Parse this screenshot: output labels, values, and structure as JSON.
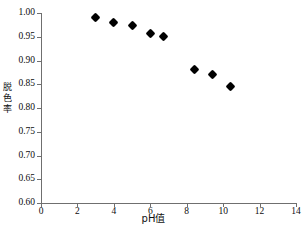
{
  "chart_data": {
    "type": "scatter",
    "title": "",
    "xlabel": "pH值",
    "ylabel": "脱色率",
    "xlim": [
      0,
      14
    ],
    "ylim": [
      0.6,
      1.0
    ],
    "grid": false,
    "legend": null,
    "x_ticks": [
      "0",
      "2",
      "4",
      "6",
      "8",
      "10",
      "12",
      "14"
    ],
    "x_tick_values": [
      0,
      2,
      4,
      6,
      8,
      10,
      12,
      14
    ],
    "y_ticks": [
      "0.60",
      "0.65",
      "0.70",
      "0.75",
      "0.80",
      "0.85",
      "0.90",
      "0.95",
      "1.00"
    ],
    "y_tick_values": [
      0.6,
      0.65,
      0.7,
      0.75,
      0.8,
      0.85,
      0.9,
      0.95,
      1.0
    ],
    "marker": "filled-diamond",
    "marker_color": "#000000",
    "axis_color": "#6f6f6f",
    "points": [
      {
        "x": 3.0,
        "y": 0.991
      },
      {
        "x": 4.0,
        "y": 0.981
      },
      {
        "x": 5.0,
        "y": 0.973
      },
      {
        "x": 6.0,
        "y": 0.956
      },
      {
        "x": 6.7,
        "y": 0.951
      },
      {
        "x": 8.4,
        "y": 0.882
      },
      {
        "x": 9.4,
        "y": 0.87
      },
      {
        "x": 10.4,
        "y": 0.846
      }
    ],
    "x": [
      3.0,
      4.0,
      5.0,
      6.0,
      6.7,
      8.4,
      9.4,
      10.4
    ],
    "values": [
      0.991,
      0.981,
      0.973,
      0.956,
      0.951,
      0.882,
      0.87,
      0.846
    ]
  },
  "axis_titles": {
    "y_chars": [
      "脱",
      "色",
      "率"
    ],
    "x": "pH值"
  },
  "bottom_caption": ""
}
